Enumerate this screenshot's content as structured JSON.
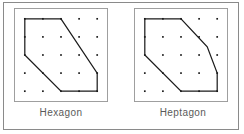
{
  "figure": {
    "kind": "geoboard-polygon-pair",
    "background_color": "#ffffff",
    "outer_frame_color": "#8a8a8a",
    "board_border_color": "#9a9a9a",
    "dot_color": "#1a1a1a",
    "polygon_stroke_color": "#1a1a1a",
    "polygon_fill": "none",
    "caption_color": "#5a5a5a",
    "grid": {
      "rows": 5,
      "columns": 5,
      "spacing_units": 1
    }
  },
  "panels": [
    {
      "id": "panel-hexagon",
      "caption": "Hexagon",
      "sides": 6,
      "vertices": [
        [
          0,
          0
        ],
        [
          2,
          0
        ],
        [
          4,
          3
        ],
        [
          4,
          4
        ],
        [
          2,
          4
        ],
        [
          0,
          2
        ]
      ]
    },
    {
      "id": "panel-heptagon",
      "caption": "Heptagon",
      "sides": 7,
      "vertices": [
        [
          0,
          0
        ],
        [
          2,
          0
        ],
        [
          3.45,
          1.55
        ],
        [
          4,
          3
        ],
        [
          4,
          4
        ],
        [
          2,
          4
        ],
        [
          0,
          2
        ]
      ]
    }
  ]
}
